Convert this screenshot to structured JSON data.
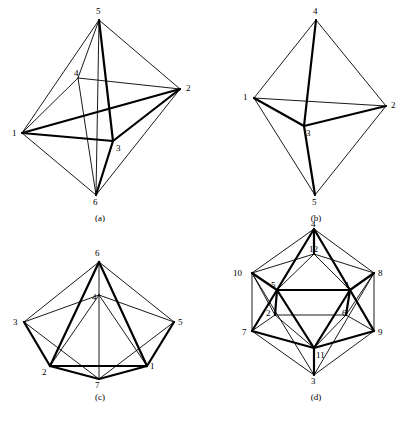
{
  "figure": {
    "background_color": "#ffffff",
    "ink_color": "#000000",
    "panel_count": 4
  },
  "panels": [
    {
      "id": "a",
      "caption": "(a)",
      "caption_x": 100,
      "caption_y": 213,
      "name": "octahedron-graph-a",
      "vertex_count": 6,
      "vertices": [
        {
          "label": "1",
          "x": 22,
          "y": 133,
          "lx": 12,
          "ly": 129
        },
        {
          "label": "2",
          "x": 180,
          "y": 89,
          "lx": 186,
          "ly": 84
        },
        {
          "label": "3",
          "x": 113,
          "y": 141,
          "lx": 116,
          "ly": 144
        },
        {
          "label": "4",
          "x": 78,
          "y": 78,
          "lx": 74,
          "ly": 69
        },
        {
          "label": "5",
          "x": 99,
          "y": 20,
          "lx": 96,
          "ly": 7
        },
        {
          "label": "6",
          "x": 96,
          "y": 195,
          "lx": 93,
          "ly": 198
        }
      ],
      "edges": [
        {
          "from": "1",
          "to": "5",
          "weight": "thin"
        },
        {
          "from": "1",
          "to": "2",
          "weight": "thick"
        },
        {
          "from": "1",
          "to": "3",
          "weight": "thick"
        },
        {
          "from": "1",
          "to": "4",
          "weight": "thin"
        },
        {
          "from": "1",
          "to": "6",
          "weight": "thin"
        },
        {
          "from": "2",
          "to": "5",
          "weight": "thin"
        },
        {
          "from": "2",
          "to": "3",
          "weight": "thick"
        },
        {
          "from": "2",
          "to": "4",
          "weight": "thin"
        },
        {
          "from": "2",
          "to": "6",
          "weight": "thin"
        },
        {
          "from": "3",
          "to": "5",
          "weight": "thick"
        },
        {
          "from": "3",
          "to": "6",
          "weight": "thick"
        },
        {
          "from": "4",
          "to": "5",
          "weight": "thin"
        },
        {
          "from": "4",
          "to": "6",
          "weight": "thin"
        },
        {
          "from": "5",
          "to": "6",
          "weight": "thin"
        }
      ]
    },
    {
      "id": "b",
      "caption": "(b)",
      "caption_x": 114,
      "caption_y": 213,
      "name": "bipyramid-graph-b",
      "vertex_count": 5,
      "vertices": [
        {
          "label": "1",
          "x": 52,
          "y": 98,
          "lx": 41,
          "ly": 93
        },
        {
          "label": "2",
          "x": 184,
          "y": 106,
          "lx": 189,
          "ly": 101
        },
        {
          "label": "3",
          "x": 102,
          "y": 126,
          "lx": 104,
          "ly": 129
        },
        {
          "label": "4",
          "x": 114,
          "y": 20,
          "lx": 111,
          "ly": 7
        },
        {
          "label": "5",
          "x": 113,
          "y": 195,
          "lx": 110,
          "ly": 198
        }
      ],
      "edges": [
        {
          "from": "1",
          "to": "4",
          "weight": "thin"
        },
        {
          "from": "1",
          "to": "2",
          "weight": "thin"
        },
        {
          "from": "1",
          "to": "3",
          "weight": "thick"
        },
        {
          "from": "1",
          "to": "5",
          "weight": "thin"
        },
        {
          "from": "2",
          "to": "4",
          "weight": "thin"
        },
        {
          "from": "2",
          "to": "3",
          "weight": "thick"
        },
        {
          "from": "2",
          "to": "5",
          "weight": "thin"
        },
        {
          "from": "3",
          "to": "4",
          "weight": "thick"
        },
        {
          "from": "3",
          "to": "5",
          "weight": "thick"
        }
      ]
    },
    {
      "id": "c",
      "caption": "(c)",
      "caption_x": 100,
      "caption_y": 172,
      "name": "pentagonal-bipyramid-graph-c",
      "vertex_count": 7,
      "vertices": [
        {
          "label": "1",
          "x": 147,
          "y": 146,
          "lx": 150,
          "ly": 142
        },
        {
          "label": "2",
          "x": 50,
          "y": 146,
          "lx": 42,
          "ly": 148
        },
        {
          "label": "3",
          "x": 24,
          "y": 102,
          "lx": 13,
          "ly": 98
        },
        {
          "label": "4",
          "x": 99,
          "y": 75,
          "lx": 92,
          "ly": 73
        },
        {
          "label": "5",
          "x": 174,
          "y": 102,
          "lx": 178,
          "ly": 98
        },
        {
          "label": "6",
          "x": 99,
          "y": 42,
          "lx": 95,
          "ly": 29
        },
        {
          "label": "7",
          "x": 99,
          "y": 159,
          "lx": 95,
          "ly": 161
        }
      ],
      "edges": [
        {
          "from": "3",
          "to": "6",
          "weight": "thin"
        },
        {
          "from": "5",
          "to": "6",
          "weight": "thin"
        },
        {
          "from": "4",
          "to": "6",
          "weight": "thin"
        },
        {
          "from": "2",
          "to": "6",
          "weight": "thick"
        },
        {
          "from": "1",
          "to": "6",
          "weight": "thick"
        },
        {
          "from": "3",
          "to": "4",
          "weight": "thin"
        },
        {
          "from": "4",
          "to": "5",
          "weight": "thin"
        },
        {
          "from": "2",
          "to": "4",
          "weight": "thin"
        },
        {
          "from": "1",
          "to": "4",
          "weight": "thin"
        },
        {
          "from": "2",
          "to": "3",
          "weight": "thick"
        },
        {
          "from": "1",
          "to": "5",
          "weight": "thick"
        },
        {
          "from": "1",
          "to": "2",
          "weight": "thick"
        },
        {
          "from": "2",
          "to": "7",
          "weight": "thick"
        },
        {
          "from": "1",
          "to": "7",
          "weight": "thick"
        },
        {
          "from": "3",
          "to": "7",
          "weight": "thin"
        },
        {
          "from": "5",
          "to": "7",
          "weight": "thin"
        },
        {
          "from": "4",
          "to": "7",
          "weight": "thin"
        }
      ]
    },
    {
      "id": "d",
      "caption": "(d)",
      "caption_x": 114,
      "caption_y": 172,
      "name": "icosahedron-graph-d",
      "vertex_count": 12,
      "vertices": [
        {
          "label": "1",
          "x": 148,
          "y": 70,
          "lx": 143,
          "ly": 61
        },
        {
          "label": "2",
          "x": 73,
          "y": 95,
          "lx": 64,
          "ly": 89
        },
        {
          "label": "3",
          "x": 112,
          "y": 155,
          "lx": 109,
          "ly": 157
        },
        {
          "label": "4",
          "x": 112,
          "y": 9,
          "lx": 109,
          "ly": 0
        },
        {
          "label": "5",
          "x": 75,
          "y": 70,
          "lx": 69,
          "ly": 61
        },
        {
          "label": "6",
          "x": 144,
          "y": 95,
          "lx": 140,
          "ly": 89
        },
        {
          "label": "7",
          "x": 50,
          "y": 111,
          "lx": 40,
          "ly": 108
        },
        {
          "label": "8",
          "x": 172,
          "y": 53,
          "lx": 176,
          "ly": 49
        },
        {
          "label": "9",
          "x": 172,
          "y": 111,
          "lx": 176,
          "ly": 108
        },
        {
          "label": "10",
          "x": 50,
          "y": 53,
          "lx": 31,
          "ly": 49
        },
        {
          "label": "11",
          "x": 112,
          "y": 128,
          "lx": 114,
          "ly": 131
        },
        {
          "label": "12",
          "x": 112,
          "y": 34,
          "lx": 107,
          "ly": 25
        }
      ],
      "edges": [
        {
          "from": "4",
          "to": "10",
          "weight": "thin"
        },
        {
          "from": "4",
          "to": "8",
          "weight": "thin"
        },
        {
          "from": "4",
          "to": "12",
          "weight": "thick"
        },
        {
          "from": "4",
          "to": "5",
          "weight": "thick"
        },
        {
          "from": "4",
          "to": "1",
          "weight": "thick"
        },
        {
          "from": "12",
          "to": "5",
          "weight": "thin"
        },
        {
          "from": "12",
          "to": "1",
          "weight": "thin"
        },
        {
          "from": "12",
          "to": "10",
          "weight": "thin"
        },
        {
          "from": "12",
          "to": "8",
          "weight": "thin"
        },
        {
          "from": "10",
          "to": "5",
          "weight": "thick"
        },
        {
          "from": "10",
          "to": "7",
          "weight": "thin"
        },
        {
          "from": "10",
          "to": "2",
          "weight": "thin"
        },
        {
          "from": "8",
          "to": "1",
          "weight": "thick"
        },
        {
          "from": "8",
          "to": "9",
          "weight": "thin"
        },
        {
          "from": "8",
          "to": "6",
          "weight": "thin"
        },
        {
          "from": "5",
          "to": "1",
          "weight": "thick"
        },
        {
          "from": "5",
          "to": "2",
          "weight": "thick"
        },
        {
          "from": "5",
          "to": "7",
          "weight": "thick"
        },
        {
          "from": "5",
          "to": "11",
          "weight": "thick"
        },
        {
          "from": "1",
          "to": "6",
          "weight": "thick"
        },
        {
          "from": "1",
          "to": "9",
          "weight": "thick"
        },
        {
          "from": "1",
          "to": "11",
          "weight": "thick"
        },
        {
          "from": "2",
          "to": "7",
          "weight": "thin"
        },
        {
          "from": "2",
          "to": "6",
          "weight": "thin"
        },
        {
          "from": "2",
          "to": "11",
          "weight": "thin"
        },
        {
          "from": "6",
          "to": "9",
          "weight": "thin"
        },
        {
          "from": "6",
          "to": "11",
          "weight": "thin"
        },
        {
          "from": "7",
          "to": "11",
          "weight": "thick"
        },
        {
          "from": "7",
          "to": "3",
          "weight": "thin"
        },
        {
          "from": "9",
          "to": "11",
          "weight": "thick"
        },
        {
          "from": "9",
          "to": "3",
          "weight": "thin"
        },
        {
          "from": "11",
          "to": "3",
          "weight": "thick"
        },
        {
          "from": "3",
          "to": "8",
          "weight": "thin"
        },
        {
          "from": "3",
          "to": "10",
          "weight": "thin"
        }
      ]
    }
  ],
  "stroke": {
    "thin_width": 0.9,
    "thick_width": 2.2
  }
}
